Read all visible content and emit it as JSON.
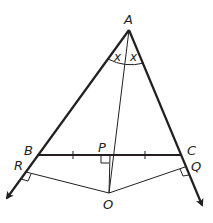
{
  "diagram": {
    "type": "geometry",
    "colors": {
      "stroke": "#231f20",
      "background": "#ffffff"
    },
    "points": {
      "A": {
        "label": "A",
        "x": 129,
        "y": 30
      },
      "B": {
        "label": "B",
        "x": 37,
        "y": 155
      },
      "C": {
        "label": "C",
        "x": 181,
        "y": 155
      },
      "P": {
        "label": "P",
        "x": 110,
        "y": 155
      },
      "O": {
        "label": "O",
        "x": 109,
        "y": 193
      },
      "R": {
        "label": "R",
        "x": 26,
        "y": 172
      },
      "Q": {
        "label": "Q",
        "x": 185,
        "y": 168
      }
    },
    "angle_labels": {
      "left": "x",
      "right": "x"
    },
    "labels": {
      "A": "A",
      "B": "B",
      "C": "C",
      "P": "P",
      "O": "O",
      "R": "R",
      "Q": "Q"
    }
  }
}
